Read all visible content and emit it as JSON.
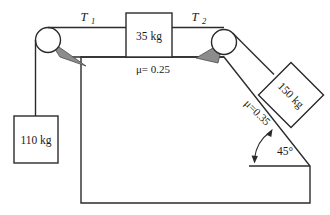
{
  "figure": {
    "colors": {
      "line": "#2b2b2b",
      "bracket_fill": "#8c8c8c",
      "body_fill": "#ffffff",
      "background": "#ffffff"
    }
  },
  "labels": {
    "tension_left": "T",
    "tension_left_sub": "1",
    "tension_right": "T",
    "tension_right_sub": "2",
    "block_table_mass": "35 kg",
    "block_hanging_mass": "110 kg",
    "block_incline_mass": "150 kg",
    "friction_table": "μ= 0.25",
    "friction_incline": "μ=0.35",
    "incline_angle": "45°"
  },
  "elements": {
    "pulley_left_name": "left pulley",
    "pulley_right_name": "right pulley",
    "table_surface_name": "horizontal table top",
    "incline_surface_name": "45 degree inclined plane",
    "cord_vertical_name": "vertical cord to hanging block",
    "cord_horizontal_left_name": "cord T1 between left pulley and 35 kg block",
    "cord_horizontal_right_name": "cord T2 between 35 kg block and right pulley",
    "cord_incline_name": "cord along incline to 150 kg block"
  },
  "values": {
    "mass_table_kg": 35,
    "mass_hanging_kg": 110,
    "mass_incline_kg": 150,
    "mu_table": 0.25,
    "mu_incline": 0.35,
    "angle_deg": 45
  }
}
